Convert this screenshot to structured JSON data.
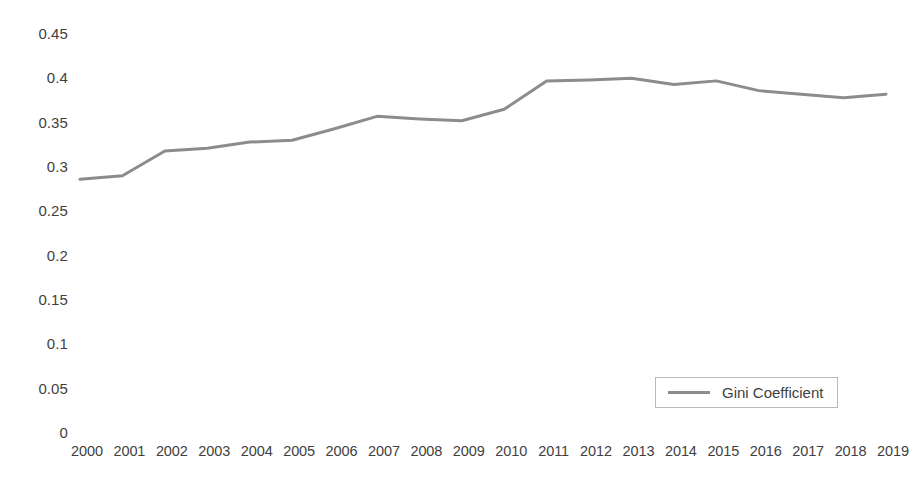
{
  "chart_data": {
    "type": "line",
    "title": "",
    "xlabel": "",
    "ylabel": "",
    "grid": false,
    "legend_position": "inside-bottom-right",
    "line_color": "#8c8c8c",
    "line_width": 3,
    "ylim": [
      0,
      0.45
    ],
    "ytick_labels": [
      "0.45",
      "0.4",
      "0.35",
      "0.3",
      "0.25",
      "0.2",
      "0.15",
      "0.1",
      "0.05",
      "0"
    ],
    "ytick_values": [
      0.45,
      0.4,
      0.35,
      0.3,
      0.25,
      0.2,
      0.15,
      0.1,
      0.05,
      0
    ],
    "categories": [
      "2000",
      "2001",
      "2002",
      "2003",
      "2004",
      "2005",
      "2006",
      "2007",
      "2008",
      "2009",
      "2010",
      "2011",
      "2012",
      "2013",
      "2014",
      "2015",
      "2016",
      "2017",
      "2018",
      "2019"
    ],
    "series": [
      {
        "name": "Gini Coefficient",
        "values": [
          0.285,
          0.289,
          0.317,
          0.32,
          0.327,
          0.329,
          0.342,
          0.356,
          0.353,
          0.351,
          0.364,
          0.396,
          0.397,
          0.399,
          0.392,
          0.396,
          0.385,
          0.381,
          0.377,
          0.381
        ]
      }
    ]
  },
  "legend": {
    "entries": [
      {
        "label": "Gini Coefficient",
        "color": "#8c8c8c"
      }
    ]
  }
}
